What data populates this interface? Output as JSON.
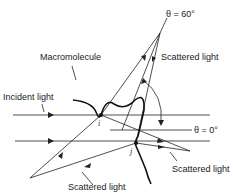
{
  "diagram": {
    "labels": {
      "theta60": "θ = 60°",
      "theta0": "θ = 0°",
      "macromolecule": "Macromolecule",
      "incident_light": "Incident light",
      "scattered_top": "Scattered light",
      "scattered_right": "Scattered light",
      "scattered_bottom": "Scattered light",
      "point_i": "i",
      "point_j": "j"
    }
  }
}
